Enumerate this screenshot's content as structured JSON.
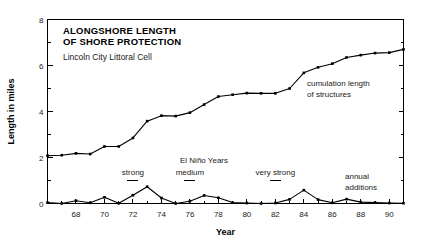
{
  "chart_data": {
    "type": "line",
    "title": "ALONGSHORE LENGTH OF SHORE PROTECTION",
    "title_line1": "ALONGSHORE LENGTH",
    "title_line2": "OF SHORE PROTECTION",
    "subtitle": "Lincoln City Littoral Cell",
    "xlabel": "Year",
    "ylabel": "Length in miles",
    "xlim": [
      66,
      91
    ],
    "ylim": [
      0,
      8
    ],
    "grid": false,
    "legend_position": "inline-annotations",
    "x": [
      66,
      67,
      68,
      69,
      70,
      71,
      72,
      73,
      74,
      75,
      76,
      77,
      78,
      79,
      80,
      81,
      82,
      83,
      84,
      85,
      86,
      87,
      88,
      89,
      90,
      91
    ],
    "xticks_major": [
      68,
      70,
      72,
      74,
      76,
      78,
      80,
      82,
      84,
      86,
      88,
      90
    ],
    "xticks_minor": [
      66,
      67,
      69,
      71,
      73,
      75,
      77,
      79,
      81,
      83,
      85,
      87,
      89,
      91
    ],
    "yticks_major": [
      0,
      2,
      4,
      6,
      8
    ],
    "yticks_minor": [
      1,
      3,
      5,
      7
    ],
    "series": [
      {
        "name": "cumulation length of structures",
        "label_line1": "cumulation length",
        "label_line2": "of structures",
        "values": [
          2.08,
          2.1,
          2.18,
          2.15,
          2.48,
          2.48,
          2.85,
          3.58,
          3.82,
          3.8,
          3.95,
          4.3,
          4.65,
          4.73,
          4.8,
          4.79,
          4.79,
          5.0,
          5.68,
          5.92,
          6.08,
          6.35,
          6.45,
          6.54,
          6.56,
          6.7
        ]
      },
      {
        "name": "annual additions",
        "label_line1": "annual",
        "label_line2": "additions",
        "values": [
          0.04,
          0.0,
          0.12,
          0.03,
          0.27,
          0.01,
          0.36,
          0.73,
          0.24,
          0.0,
          0.1,
          0.35,
          0.25,
          0.04,
          0.02,
          0.0,
          0.02,
          0.18,
          0.58,
          0.17,
          0.03,
          0.19,
          0.06,
          0.04,
          0.02,
          0.01
        ]
      }
    ],
    "annotations": {
      "elnino_header": "El Niño Years",
      "events": [
        {
          "label": "strong",
          "year": 72
        },
        {
          "label": "medium",
          "year": 76
        },
        {
          "label": "very strong",
          "year": 82
        }
      ]
    }
  }
}
